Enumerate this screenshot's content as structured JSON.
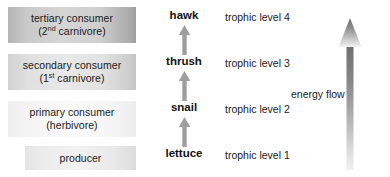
{
  "diagram": {
    "colors": {
      "text": "#1a1a1a",
      "arrow_gray": "#9a9a9a",
      "energy_arrow_top": "#6e6e6e",
      "box_darkest": "#b4b4b4",
      "background": "#ffffff"
    },
    "roles": [
      {
        "name": "tertiary-consumer",
        "line1": "tertiary consumer",
        "prefix": "(2",
        "superscript": "nd",
        "suffix": " carnivore)"
      },
      {
        "name": "secondary-consumer",
        "line1": "secondary consumer",
        "prefix": "(1",
        "superscript": "st",
        "suffix": " carnivore)"
      },
      {
        "name": "primary-consumer",
        "line1": "primary consumer",
        "line2": "(herbivore)"
      },
      {
        "name": "producer",
        "line1": "producer"
      }
    ],
    "organisms": [
      {
        "name": "hawk",
        "label": "hawk"
      },
      {
        "name": "thrush",
        "label": "thrush"
      },
      {
        "name": "snail",
        "label": "snail"
      },
      {
        "name": "lettuce",
        "label": "lettuce"
      }
    ],
    "chain_arrows": [
      {
        "name": "lettuce-to-snail",
        "direction": "up"
      },
      {
        "name": "snail-to-thrush",
        "direction": "up"
      },
      {
        "name": "thrush-to-hawk",
        "direction": "up"
      }
    ],
    "trophic_levels": [
      {
        "name": "level-4",
        "label": "trophic level 4"
      },
      {
        "name": "level-3",
        "label": "trophic level 3"
      },
      {
        "name": "level-2",
        "label": "trophic level 2"
      },
      {
        "name": "level-1",
        "label": "trophic level 1"
      }
    ],
    "energy_flow": {
      "label": "energy flow",
      "direction": "up"
    }
  }
}
